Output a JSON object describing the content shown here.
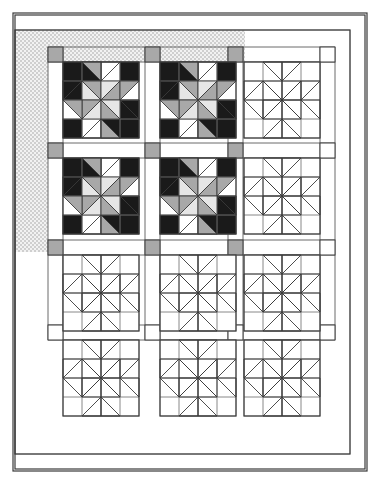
{
  "document": {
    "kind": "quilt-pattern-diagram",
    "title": "Pinwheel Block Quilt Layout Diagram",
    "description": "Line-drawing quilt layout: three columns by four rows of pinwheel blocks separated by sashing strips with cornerstone squares, enclosed by an inner border and an outer border. The upper-left four blocks are rendered in fabric values; remaining blocks are shown as outlines. A stippled shading band marks the top and left border strips."
  },
  "colors": {
    "paper": "#ffffff",
    "line": "#3a3a3a",
    "line_light": "#6b6b6b",
    "dark_fabric": "#1a1a1a",
    "medium_fabric": "#a8a8a8",
    "light_print_fabric": "#e6e6e6",
    "background_fabric": "#ffffff",
    "cornerstone": "#a8a8a8",
    "stipple_shade": "#e9e9e9",
    "stipple_dot": "#b9b9b9"
  },
  "canvas": {
    "width": 380,
    "height": 484
  },
  "frame": {
    "outer_border": {
      "x": 13,
      "y": 13,
      "width": 354,
      "height": 458,
      "label": "outer border"
    },
    "inner_border": {
      "x": 15,
      "y": 15,
      "width": 350,
      "height": 454,
      "label": "inner border"
    },
    "quilt_top": {
      "x": 15,
      "y": 30,
      "width": 335,
      "height": 424,
      "label": "quilt top field"
    }
  },
  "layout": {
    "columns": 3,
    "rows": 4,
    "block_size": 76,
    "sashing_width": 15,
    "grid_origin_x": 48,
    "grid_origin_y": 47,
    "block_origins_x": [
      63,
      160,
      244
    ],
    "block_origins_y": [
      62,
      158,
      255,
      340
    ],
    "cornerstone_x": [
      48,
      145,
      228,
      320
    ],
    "cornerstone_y": [
      47,
      143,
      240,
      325
    ],
    "cornerstone_size": 15
  },
  "blocks": [
    {
      "id": "r1c1",
      "row": 1,
      "col": 1,
      "style": "colored",
      "label": "pinwheel block row 1 column 1"
    },
    {
      "id": "r1c2",
      "row": 1,
      "col": 2,
      "style": "colored",
      "label": "pinwheel block row 1 column 2"
    },
    {
      "id": "r1c3",
      "row": 1,
      "col": 3,
      "style": "outline",
      "label": "pinwheel block row 1 column 3"
    },
    {
      "id": "r2c1",
      "row": 2,
      "col": 1,
      "style": "colored",
      "label": "pinwheel block row 2 column 1"
    },
    {
      "id": "r2c2",
      "row": 2,
      "col": 2,
      "style": "colored",
      "label": "pinwheel block row 2 column 2"
    },
    {
      "id": "r2c3",
      "row": 2,
      "col": 3,
      "style": "outline",
      "label": "pinwheel block row 2 column 3"
    },
    {
      "id": "r3c1",
      "row": 3,
      "col": 1,
      "style": "outline",
      "label": "pinwheel block row 3 column 1"
    },
    {
      "id": "r3c2",
      "row": 3,
      "col": 2,
      "style": "outline",
      "label": "pinwheel block row 3 column 2"
    },
    {
      "id": "r3c3",
      "row": 3,
      "col": 3,
      "style": "outline",
      "label": "pinwheel block row 3 column 3"
    },
    {
      "id": "r4c1",
      "row": 4,
      "col": 1,
      "style": "outline",
      "label": "pinwheel block row 4 column 1"
    },
    {
      "id": "r4c2",
      "row": 4,
      "col": 2,
      "style": "outline",
      "label": "pinwheel block row 4 column 2"
    },
    {
      "id": "r4c3",
      "row": 4,
      "col": 3,
      "style": "outline",
      "label": "pinwheel block row 4 column 3"
    }
  ],
  "block_pattern": {
    "grid": 4,
    "unit_size": 19,
    "name": "pinwheel with corner squares",
    "corner_units": [
      "dark",
      "dark",
      "dark",
      "dark"
    ],
    "edge_units": [
      "background",
      "background",
      "background",
      "background"
    ],
    "center_units": [
      "medium",
      "light-print",
      "medium",
      "light-print"
    ],
    "notes": "Each block is a four-by-four unit grid. Four dark corner squares, background squares between them, and a central four-unit pinwheel of half-square triangles in medium and light-print values."
  },
  "shading": {
    "top_band": {
      "x": 15,
      "y": 30,
      "width": 230,
      "height": 32,
      "label": "stippled shading over top border strip"
    },
    "left_band": {
      "x": 15,
      "y": 30,
      "width": 33,
      "height": 222,
      "label": "stippled shading over left border strip"
    }
  },
  "legend": {
    "dark": "dark value fabric",
    "medium": "medium value fabric",
    "light_print": "light print fabric",
    "background": "background fabric",
    "cornerstone": "sashing cornerstone square"
  }
}
